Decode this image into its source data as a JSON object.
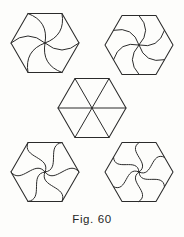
{
  "figure": {
    "caption": "Fig. 60",
    "title": "Fig. 60",
    "background_color": "#fdfdfb",
    "ink_color": "#2b2b2b",
    "width": 184,
    "height": 237,
    "panel_count": 5,
    "layout": "quincunx"
  },
  "panels": [
    {
      "id": "top-left",
      "name": "hexagon-arc-to-vertex",
      "label": "Hexagon with single-arc spokes to vertices",
      "center_x": 45,
      "center_y": 43,
      "radius": 34,
      "spoke_count": 6,
      "spoke_style": "arc",
      "spoke_target": "vertex",
      "swirl": "counterclockwise",
      "bow": 0.42
    },
    {
      "id": "top-right",
      "name": "hexagon-arc-to-edge-midpoint",
      "label": "Hexagon with single-arc spokes to edge midpoints",
      "center_x": 139,
      "center_y": 45,
      "radius": 34,
      "spoke_count": 6,
      "spoke_style": "arc",
      "spoke_target": "edge-midpoint",
      "swirl": "counterclockwise",
      "bow": 0.46
    },
    {
      "id": "center",
      "name": "hexagon-straight-radii",
      "label": "Hexagon with straight radii to vertices",
      "center_x": 92,
      "center_y": 108,
      "radius": 34,
      "spoke_count": 6,
      "spoke_style": "straight",
      "spoke_target": "vertex",
      "swirl": "none",
      "bow": 0
    },
    {
      "id": "bottom-left",
      "name": "hexagon-ogee-to-vertex",
      "label": "Hexagon with S-curve spokes to vertices",
      "center_x": 45,
      "center_y": 172,
      "radius": 34,
      "spoke_count": 6,
      "spoke_style": "ogee",
      "spoke_target": "vertex",
      "swirl": "counterclockwise",
      "bow": 0.4
    },
    {
      "id": "bottom-right",
      "name": "hexagon-ogee-to-edge-midpoint",
      "label": "Hexagon with S-curve spokes to edge midpoints",
      "center_x": 139,
      "center_y": 172,
      "radius": 34,
      "spoke_count": 6,
      "spoke_style": "ogee",
      "spoke_target": "edge-midpoint",
      "swirl": "counterclockwise",
      "bow": 0.44
    }
  ]
}
